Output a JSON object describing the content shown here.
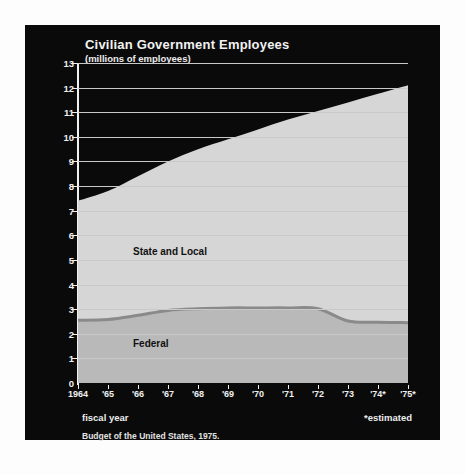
{
  "chart_data": {
    "type": "area",
    "title": "Civilian Government Employees",
    "subtitle": "(millions of employees)",
    "xlabel": "fiscal year",
    "ylabel": "",
    "ylim": [
      0,
      13
    ],
    "ytick_step": 1,
    "grid": true,
    "stacked": true,
    "legend": "inline-labels",
    "footnote": "*estimated",
    "source": "Budget of the United States, 1975.",
    "categories": [
      "1964",
      "'65",
      "'66",
      "'67",
      "'68",
      "'69",
      "'70",
      "'71",
      "'72",
      "'73",
      "'74*",
      "'75*"
    ],
    "yticks": [
      "0",
      "1",
      "2",
      "3",
      "4",
      "5",
      "6",
      "7",
      "8",
      "9",
      "10",
      "11",
      "12",
      "13"
    ],
    "series": [
      {
        "name": "Federal",
        "color": "#b9b9b9",
        "values": [
          2.55,
          2.58,
          2.75,
          2.95,
          3.02,
          3.05,
          3.05,
          3.05,
          3.02,
          2.52,
          2.47,
          2.45
        ]
      },
      {
        "name": "State and Local",
        "color": "#d6d6d6",
        "values": [
          4.85,
          5.22,
          5.65,
          6.05,
          6.48,
          6.85,
          7.25,
          7.65,
          8.03,
          8.88,
          9.28,
          9.65
        ]
      }
    ],
    "totals": [
      7.4,
      7.8,
      8.4,
      9.0,
      9.5,
      9.9,
      10.3,
      10.7,
      11.05,
      11.4,
      11.75,
      12.1
    ],
    "colors": {
      "background": "#0a0a0a",
      "page": "#fdfdfd",
      "grid": "#c9c9c9",
      "axis": "#f0f0f0",
      "text_light": "#f0f0f0",
      "text_dark": "#111111",
      "divider": "#8a8a8a"
    }
  }
}
